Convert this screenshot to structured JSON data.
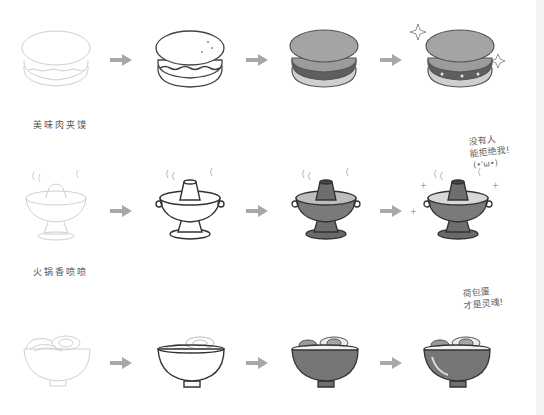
{
  "rows": [
    {
      "id": "meat-bun",
      "caption": "美味肉夹馍",
      "stages": [
        "sketch",
        "lineart",
        "color",
        "highlights"
      ],
      "note": null
    },
    {
      "id": "hotpot",
      "caption": "火锅香喷喷",
      "stages": [
        "sketch",
        "lineart",
        "color",
        "highlights"
      ],
      "note": {
        "line1": "没有人",
        "line2": "能拒绝我!",
        "line3": "(•'ω•)"
      }
    },
    {
      "id": "noodle-bowl",
      "caption": null,
      "stages": [
        "sketch",
        "lineart",
        "color",
        "highlights"
      ],
      "note": {
        "line1": "荷包蛋",
        "line2": "才是灵魂!"
      }
    }
  ],
  "arrow_icon": "right-arrow-icon",
  "colors": {
    "sketch_line": "#c8c8c8",
    "ink_line": "#333333",
    "fill_dark": "#6e6e6e",
    "fill_mid": "#9a9a9a",
    "fill_light": "#cfcfcf",
    "arrow": "#a8a8a8"
  }
}
